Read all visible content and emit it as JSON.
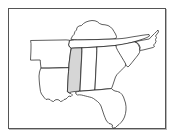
{
  "figure": {
    "kind": "choropleth-map",
    "title": "",
    "frame_border_color": "#555555",
    "frame_shadow_color": "#b8b8b8",
    "background_color": "#ffffff"
  },
  "map": {
    "region_label": "Southeastern United States",
    "outline_color": "#1a1a1a",
    "default_fill": "#ffffff",
    "highlight_fill": "#d6d6d6",
    "highlighted_states": [
      "Mississippi"
    ],
    "states": [
      {
        "name": "Kentucky",
        "abbr": "KY",
        "highlighted": false,
        "path": "M 62 30 L 63.5 27 L 65 25.5 L 66 22.5 L 67.5 21 L 68 18.5 L 70 17 L 72.5 16.5 L 74.5 14.5 L 77 13 L 80 12 L 83 11.5 L 86 11.8 L 88.5 12.8 L 90.5 14.5 L 93 15.5 L 96 15.8 L 99 16.5 L 101.5 18 L 103.5 20 L 105 22.5 L 106.5 25 L 107.5 27.5 L 107 29.5 L 104 30 L 100 30.2 L 96 30.3 L 92 30.4 L 88 30.5 L 84 30.6 L 80 30.7 L 76 30.8 L 72 30.9 L 68.5 31 L 65.5 30.8 Z"
      },
      {
        "name": "Tennessee",
        "abbr": "TN",
        "highlighted": false,
        "path": "M 61 31.5 L 65.5 30.9 L 70 30.9 L 75 30.8 L 80 30.7 L 85 30.6 L 90 30.5 L 95 30.3 L 100 30.2 L 105 30 L 109 29.8 L 113 29.5 L 117 29 L 121 28.3 L 125 27.6 L 129 27 L 133 26.3 L 137 25.8 L 140 25.5 L 140.5 27 L 138 28.5 L 134 30 L 130 31.3 L 126 32.5 L 122 33.6 L 118 34.6 L 114 35.4 L 110 36 L 106 36.5 L 101 37 L 96 37.4 L 91 37.8 L 86 38.1 L 81 38.4 L 76 38.6 L 71 38.8 L 66 39 L 62.5 39.2 L 60.5 38 L 59.5 36 L 60 33.5 Z"
      },
      {
        "name": "Arkansas",
        "abbr": "AR",
        "highlighted": false,
        "path": "M 22 31.5 L 28 31.4 L 34 31.3 L 40 31.2 L 46 31.1 L 52 31 L 57 30.9 L 60.5 31.2 L 60 33.5 L 59.5 36 L 60.5 38 L 62 39.2 L 61.5 43 L 61 47 L 60.5 51 L 60 55 L 59.8 58.5 L 56 58.6 L 52 58.7 L 48 58.8 L 44 58.9 L 40 59 L 36 59 L 32 59 L 31.5 55 L 31.2 51 L 28 51 L 24 51.1 L 21.5 51.1 L 21.7 47 L 21.9 43 L 22 39 L 22 35 Z"
      },
      {
        "name": "Louisiana",
        "abbr": "LA",
        "highlighted": false,
        "path": "M 32 59.2 L 36 59.2 L 40 59.2 L 44 59.1 L 48 59 L 52 58.9 L 56 58.8 L 59.8 58.7 L 59.5 63 L 59.2 67 L 59 71 L 58.8 75 L 58.6 79 L 58.4 82.5 L 60 84 L 62 84.5 L 63.5 86 L 62 87.5 L 60 87 L 58.5 88.5 L 57 90 L 55 90.5 L 53.5 92 L 51.5 92.5 L 50 91 L 48 90.5 L 46 91 L 44.5 92.5 L 42.5 92 L 41 90.5 L 39 90 L 37 90.5 L 35.5 89 L 34 87 L 32.5 85 L 31.5 82.5 L 31 79 L 30.5 75 L 30.2 71 L 30 67 L 30.5 63 L 31.5 60 Z"
      },
      {
        "name": "Mississippi",
        "abbr": "MS",
        "highlighted": true,
        "path": "M 59.9 58.7 L 60 55 L 60.5 51 L 61 47 L 61.5 43 L 62.5 39.2 L 66 39 L 70 38.9 L 73 38.8 L 72.8 43 L 72.6 47 L 72.4 51 L 72.2 55 L 72 59 L 71.8 63 L 71.6 67 L 71.4 71 L 71.2 75 L 71 79 L 70.8 82 L 68 82.3 L 65 82.6 L 62.5 83 L 60.5 83.6 L 58.4 82.8 L 58.6 79 L 58.8 75 L 59 71 L 59.2 67 L 59.5 63 Z"
      },
      {
        "name": "Alabama",
        "abbr": "AL",
        "highlighted": false,
        "path": "M 73.2 38.8 L 77 38.6 L 81 38.4 L 85 38.2 L 88 38 L 87.8 42 L 87.6 46 L 87.4 50 L 87.2 54 L 87 58 L 86.8 62 L 86.6 66 L 86.4 70 L 86.2 74 L 86 78 L 85.8 81 L 82 81.3 L 78 81.6 L 74 81.9 L 71 82.1 L 71.2 78 L 71.4 74 L 71.6 70 L 71.8 66 L 72 62 L 72.2 58 L 72.4 54 L 72.6 50 L 72.8 46 L 73 42 Z"
      },
      {
        "name": "Georgia",
        "abbr": "GA",
        "highlighted": false,
        "path": "M 88.2 37.9 L 92 37.7 L 96 37.4 L 100 37.1 L 104 36.7 L 107 36.4 L 108.5 39 L 110 42 L 111.5 45 L 113 47.5 L 114.5 50 L 116 52.5 L 117 55 L 116 57.5 L 114 59.5 L 112 61.5 L 110 63.5 L 108 65.5 L 106.5 68 L 105.5 71 L 104.5 74 L 103.5 77 L 102.5 79.5 L 99 79.8 L 95 80.2 L 91 80.6 L 87 80.9 L 85.9 81 L 86.1 78 L 86.3 74 L 86.5 70 L 86.7 66 L 86.9 62 L 87.1 58 L 87.3 54 L 87.5 50 L 87.7 46 L 87.9 42 Z"
      },
      {
        "name": "Florida",
        "abbr": "FL",
        "highlighted": false,
        "path": "M 70.9 82.3 L 74 82 L 78 81.7 L 82 81.4 L 86 81.1 L 90 80.8 L 94 80.4 L 98 80 L 102.5 79.6 L 104 81 L 106 82 L 108.5 82.5 L 111 83.5 L 113 85.5 L 114.5 88 L 115.5 91 L 116.5 94 L 117 97.5 L 117 101 L 116.5 104.5 L 115.5 108 L 114 111 L 112 113.5 L 110 115.5 L 108 117 L 106.5 118.5 L 104.5 119 L 103 118 L 103.5 116 L 102 115 L 100 114.5 L 98.5 113 L 97 111 L 96 108.5 L 95 106 L 94 103 L 93 100 L 92 97 L 90.5 94.5 L 88.5 92.5 L 86.5 91 L 84.5 89.5 L 82.5 88.5 L 80.5 88 L 78.5 87.5 L 76.5 87 L 74.5 86.5 L 72.5 86 L 70.5 85.8 L 68.5 86 L 67 85 L 66.5 83.5 L 68 82.8 Z"
      },
      {
        "name": "South Carolina",
        "abbr": "SC",
        "highlighted": false,
        "path": "M 107.2 36.3 L 111 35.7 L 115 35 L 119 34.2 L 123 33.4 L 126 32.8 L 128 34 L 129.5 36 L 130.5 38.5 L 131 41 L 130.5 43.5 L 129 46 L 127 48.5 L 125 51 L 123 53.5 L 121 56 L 119 58 L 117.2 56.5 L 116.2 54 L 114.7 51.5 L 113.2 49 L 111.7 46.5 L 110.2 44 L 108.7 41.5 L 107.5 39 Z"
      },
      {
        "name": "North Carolina",
        "abbr": "NC",
        "highlighted": false,
        "path": "M 126.2 32.7 L 130 31.9 L 134 31.1 L 138 30.4 L 140.2 30 L 143 27 L 145.5 24.5 L 147.5 22.5 L 149 21 L 149.5 23 L 148 25 L 146.5 27 L 147.5 28.5 L 146.5 30.5 L 147 32.5 L 146 34.5 L 144.5 36 L 145.5 37.5 L 144 38.5 L 142 39 L 140 39.5 L 138 40 L 136 40.5 L 134 41 L 132 41.3 L 130.5 41.2 L 131.2 38.5 L 130.2 36 L 128.5 34 Z"
      }
    ]
  }
}
